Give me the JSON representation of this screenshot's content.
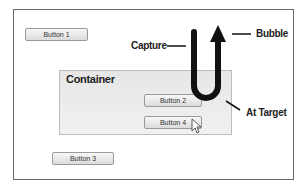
{
  "diagram": {
    "buttons": [
      {
        "id": "button1",
        "label": "Button 1"
      },
      {
        "id": "button2",
        "label": "Button 2"
      },
      {
        "id": "button3",
        "label": "Button 3"
      },
      {
        "id": "button4",
        "label": "Button 4"
      }
    ],
    "container": {
      "title": "Container"
    },
    "annotations": {
      "capture": "Capture",
      "bubble": "Bubble",
      "at_target": "At Target"
    },
    "colors": {
      "arrow": "#111111",
      "frame_border": "#6a6a6a",
      "container_bg": "#e9e9e9"
    }
  }
}
